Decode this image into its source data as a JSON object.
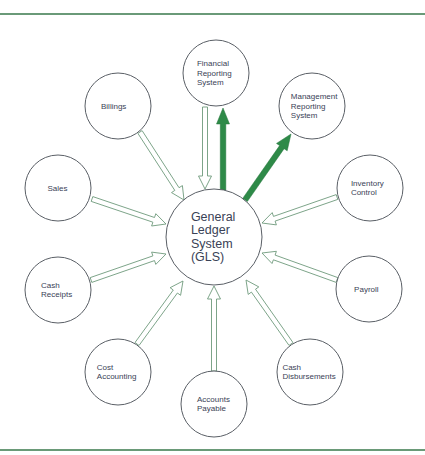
{
  "diagram": {
    "center": {
      "id": "gls",
      "label_lines": [
        "General",
        "Ledger",
        "System",
        "(GLS)"
      ],
      "cx": 214,
      "cy": 237,
      "r": 48
    },
    "colors": {
      "rule": "#6a9a78",
      "hollow_arrow_stroke": "#6e9a7c",
      "solid_arrow_fill": "#2e8a48",
      "circle_stroke": "#5a5f66",
      "text": "#3a4256"
    },
    "nodes": [
      {
        "id": "financial-reporting-system",
        "label_lines": [
          "Financial",
          "Reporting",
          "System"
        ],
        "cx": 216,
        "cy": 73,
        "r": 33,
        "flow": "out"
      },
      {
        "id": "management-reporting-system",
        "label_lines": [
          "Management",
          "Reporting",
          "System"
        ],
        "cx": 312,
        "cy": 106,
        "r": 33,
        "flow": "out"
      },
      {
        "id": "billings",
        "label_lines": [
          "Billings"
        ],
        "cx": 118,
        "cy": 106,
        "r": 33,
        "flow": "in"
      },
      {
        "id": "sales",
        "label_lines": [
          "Sales"
        ],
        "cx": 58,
        "cy": 188,
        "r": 33,
        "flow": "in"
      },
      {
        "id": "cash-receipts",
        "label_lines": [
          "Cash",
          "Receipts"
        ],
        "cx": 58,
        "cy": 290,
        "r": 33,
        "flow": "in"
      },
      {
        "id": "cost-accounting",
        "label_lines": [
          "Cost",
          "Accounting"
        ],
        "cx": 118,
        "cy": 372,
        "r": 33,
        "flow": "in"
      },
      {
        "id": "accounts-payable",
        "label_lines": [
          "Accounts",
          "Payable"
        ],
        "cx": 214,
        "cy": 404,
        "r": 33,
        "flow": "in"
      },
      {
        "id": "cash-disbursements",
        "label_lines": [
          "Cash",
          "Disbursements"
        ],
        "cx": 310,
        "cy": 372,
        "r": 33,
        "flow": "in"
      },
      {
        "id": "payroll",
        "label_lines": [
          "Payroll"
        ],
        "cx": 369,
        "cy": 289,
        "r": 33,
        "flow": "in"
      },
      {
        "id": "inventory-control",
        "label_lines": [
          "Inventory",
          "Control"
        ],
        "cx": 370,
        "cy": 188,
        "r": 33,
        "flow": "in"
      }
    ],
    "hollow_arrows": [
      {
        "from": "financial-reporting-system",
        "to": "gls",
        "x1": 205,
        "y1": 107,
        "x2": 205,
        "y2": 189
      },
      {
        "from": "billings",
        "to": "gls",
        "x1": 140,
        "y1": 132,
        "x2": 184,
        "y2": 200
      },
      {
        "from": "sales",
        "to": "gls",
        "x1": 92,
        "y1": 199,
        "x2": 166,
        "y2": 224
      },
      {
        "from": "cash-receipts",
        "to": "gls",
        "x1": 91,
        "y1": 280,
        "x2": 166,
        "y2": 254
      },
      {
        "from": "cost-accounting",
        "to": "gls",
        "x1": 137,
        "y1": 344,
        "x2": 183,
        "y2": 281
      },
      {
        "from": "accounts-payable",
        "to": "gls",
        "x1": 214,
        "y1": 371,
        "x2": 214,
        "y2": 286
      },
      {
        "from": "cash-disbursements",
        "to": "gls",
        "x1": 291,
        "y1": 344,
        "x2": 246,
        "y2": 280
      },
      {
        "from": "payroll",
        "to": "gls",
        "x1": 337,
        "y1": 280,
        "x2": 262,
        "y2": 253
      },
      {
        "from": "inventory-control",
        "to": "gls",
        "x1": 337,
        "y1": 197,
        "x2": 262,
        "y2": 223
      }
    ],
    "solid_arrows": [
      {
        "from": "gls",
        "to": "financial-reporting-system",
        "x1": 223,
        "y1": 190,
        "x2": 223,
        "y2": 108
      },
      {
        "from": "gls",
        "to": "management-reporting-system",
        "x1": 245,
        "y1": 200,
        "x2": 291,
        "y2": 134
      }
    ]
  }
}
